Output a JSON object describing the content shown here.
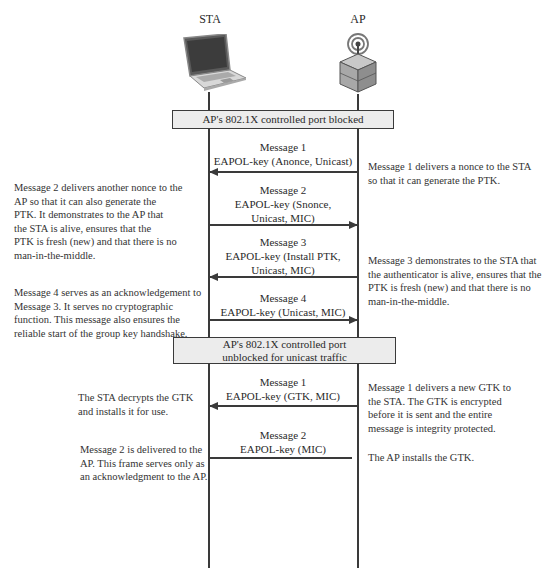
{
  "actors": {
    "sta": {
      "label": "STA",
      "icon": "laptop-icon"
    },
    "ap": {
      "label": "AP",
      "icon": "access-point-icon"
    }
  },
  "port_states": [
    {
      "lines": [
        "AP's 802.1X controlled port blocked"
      ]
    },
    {
      "lines": [
        "AP's 802.1X controlled port",
        "unblocked for unicast traffic"
      ]
    }
  ],
  "four_way_handshake": [
    {
      "title": "Message 1",
      "content": [
        "EAPOL-key (Anonce, Unicast)"
      ],
      "direction": "AP->STA",
      "note_side": "right",
      "note": [
        "Message 1 delivers a nonce to the STA",
        "so that it can generate the PTK."
      ]
    },
    {
      "title": "Message 2",
      "content": [
        "EAPOL-key (Snonce,",
        "Unicast, MIC)"
      ],
      "direction": "STA->AP",
      "note_side": "left",
      "note": [
        "Message 2 delivers another nonce to the",
        "AP so that it can also generate the",
        "PTK. It demonstrates to the AP that",
        "the STA is alive, ensures that the",
        "PTK is fresh (new) and that there is no",
        "man-in-the-middle."
      ]
    },
    {
      "title": "Message 3",
      "content": [
        "EAPOL-key (Install PTK,",
        "Unicast, MIC)"
      ],
      "direction": "AP->STA",
      "note_side": "right",
      "note": [
        "Message 3 demonstrates to the STA that",
        "the authenticator is alive, ensures that the",
        "PTK is fresh (new) and that there is no",
        "man-in-the-middle."
      ]
    },
    {
      "title": "Message 4",
      "content": [
        "EAPOL-key (Unicast, MIC)"
      ],
      "direction": "STA->AP",
      "note_side": "left",
      "note": [
        "Message 4 serves as an acknowledgement to",
        "Message 3. It serves no cryptographic",
        "function. This message also ensures the",
        "reliable start of the group key handshake."
      ]
    }
  ],
  "group_key_handshake": [
    {
      "title": "Message 1",
      "content": [
        "EAPOL-key (GTK, MIC)"
      ],
      "direction": "AP->STA",
      "note_left": [
        "The STA decrypts the GTK",
        "and installs it for use."
      ],
      "note_right": [
        "Message 1 delivers a new GTK to",
        "the STA. The GTK is encrypted",
        "before it is sent and the entire",
        "message is integrity protected."
      ]
    },
    {
      "title": "Message 2",
      "content": [
        "EAPOL-key (MIC)"
      ],
      "direction": "STA->AP",
      "note_left": [
        "Message 2 is delivered to the",
        "AP. This frame serves only as",
        "an acknowledgment to the AP."
      ],
      "note_right": [
        "The AP installs the GTK."
      ]
    }
  ],
  "colors": {
    "line": "#3a3a3a",
    "box_fill": "#ececec",
    "text": "#2a2a2a"
  }
}
